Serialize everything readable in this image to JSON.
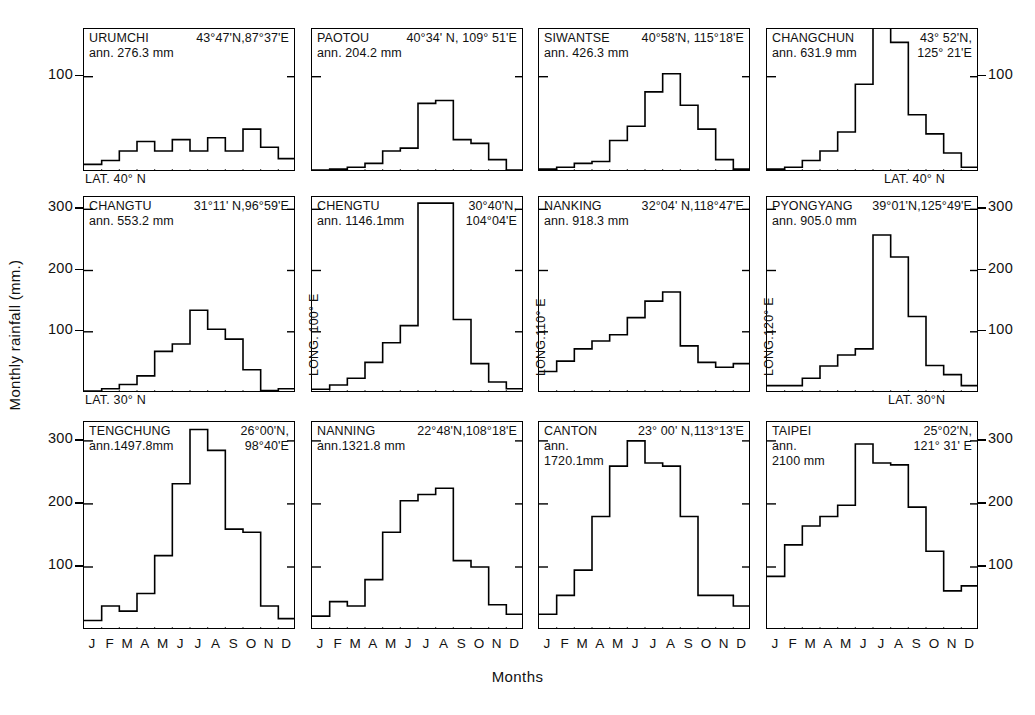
{
  "figure": {
    "ylabel": "Monthly rainfall (mm.)",
    "xlabel": "Months",
    "months": [
      "J",
      "F",
      "M",
      "A",
      "M",
      "J",
      "J",
      "A",
      "S",
      "O",
      "N",
      "D"
    ],
    "lat_labels": [
      {
        "text": "LAT. 40° N"
      },
      {
        "text": "LAT. 40° N"
      },
      {
        "text": "LAT. 30° N"
      },
      {
        "text": "LAT. 30°N"
      }
    ],
    "long_labels": [
      {
        "text": "LONG. 100° E"
      },
      {
        "text": "LONG.110° E"
      },
      {
        "text": "LONG.120° E"
      }
    ],
    "line_color": "#000000",
    "border_color": "#000000"
  },
  "axes": {
    "row1_left_ticks": [
      "100"
    ],
    "row1_right_ticks": [
      "100"
    ],
    "row2_left_ticks": [
      "300",
      "200",
      "100"
    ],
    "row2_right_ticks": [
      "300",
      "200",
      "100"
    ],
    "row3_left_ticks": [
      "300",
      "200",
      "100"
    ],
    "row3_right_ticks": [
      "300",
      "200",
      "100"
    ]
  },
  "chart_data": {
    "type": "bar",
    "xlabel": "Months",
    "ylabel": "Monthly rainfall (mm.)",
    "categories": [
      "J",
      "F",
      "M",
      "A",
      "M",
      "J",
      "J",
      "A",
      "S",
      "O",
      "N",
      "D"
    ],
    "grid": false,
    "legend": "none",
    "panels": [
      {
        "row": 1,
        "col": 1,
        "station": "URUMCHI",
        "coords": "43°47'N,87°37'E",
        "annual_label": "ann. 276.3 mm",
        "annual_mm": 276.3,
        "ylim": [
          0,
          150
        ],
        "yticks": [
          100
        ],
        "values": [
          8,
          12,
          22,
          32,
          22,
          34,
          22,
          36,
          22,
          45,
          26,
          14
        ]
      },
      {
        "row": 1,
        "col": 2,
        "station": "PAOTOU",
        "coords": "40°34' N, 109° 51'E",
        "annual_label": "ann. 204.2 mm",
        "annual_mm": 204.2,
        "ylim": [
          0,
          150
        ],
        "yticks": [
          100
        ],
        "values": [
          2,
          3,
          5,
          9,
          22,
          25,
          72,
          75,
          34,
          30,
          13,
          2
        ]
      },
      {
        "row": 1,
        "col": 3,
        "station": "SIWANTSE",
        "coords": "40°58'N, 115°18'E",
        "annual_label": "ann. 426.3 mm",
        "annual_mm": 426.3,
        "ylim": [
          0,
          150
        ],
        "yticks": [
          100
        ],
        "values": [
          3,
          5,
          9,
          11,
          33,
          48,
          84,
          103,
          70,
          45,
          13,
          3
        ]
      },
      {
        "row": 1,
        "col": 4,
        "station": "CHANGCHUN",
        "coords": "43° 52'N, 125° 21'E",
        "annual_label": "ann. 631.9 mm",
        "annual_mm": 631.9,
        "ylim": [
          0,
          150
        ],
        "yticks": [
          100
        ],
        "values": [
          3,
          5,
          12,
          22,
          42,
          92,
          164,
          136,
          60,
          40,
          20,
          5
        ]
      },
      {
        "row": 2,
        "col": 1,
        "station": "CHANGTU",
        "coords": "31°11' N,96°59'E",
        "annual_label": "ann. 553.2 mm",
        "annual_mm": 553.2,
        "ylim": [
          0,
          320
        ],
        "yticks": [
          100,
          200,
          300
        ],
        "values": [
          3,
          7,
          14,
          28,
          68,
          80,
          135,
          104,
          88,
          38,
          4,
          7
        ]
      },
      {
        "row": 2,
        "col": 2,
        "station": "CHENGTU",
        "coords": "30°40'N, 104°04'E",
        "annual_label": "ann. 1146.1mm",
        "annual_mm": 1146.1,
        "ylim": [
          0,
          320
        ],
        "yticks": [
          100,
          200,
          300
        ],
        "values": [
          6,
          13,
          24,
          50,
          82,
          110,
          310,
          310,
          120,
          48,
          18,
          7
        ]
      },
      {
        "row": 2,
        "col": 3,
        "station": "NANKING",
        "coords": "32°04' N,118°47'E",
        "annual_label": "ann. 918.3 mm",
        "annual_mm": 918.3,
        "ylim": [
          0,
          320
        ],
        "yticks": [
          100,
          200,
          300
        ],
        "values": [
          35,
          52,
          72,
          85,
          95,
          123,
          150,
          165,
          77,
          50,
          42,
          48
        ]
      },
      {
        "row": 2,
        "col": 4,
        "station": "PYONGYANG",
        "coords": "39°01'N,125°49'E",
        "annual_label": "ann. 905.0 mm",
        "annual_mm": 905.0,
        "ylim": [
          0,
          320
        ],
        "yticks": [
          100,
          200,
          300
        ],
        "values": [
          12,
          12,
          24,
          44,
          62,
          72,
          258,
          222,
          125,
          45,
          30,
          12
        ]
      },
      {
        "row": 3,
        "col": 1,
        "station": "TENGCHUNG",
        "coords": "26°00'N, 98°40'E",
        "annual_label": "ann.1497.8mm",
        "annual_mm": 1497.8,
        "ylim": [
          0,
          330
        ],
        "yticks": [
          100,
          200,
          300
        ],
        "values": [
          15,
          38,
          30,
          58,
          118,
          232,
          318,
          285,
          160,
          155,
          38,
          18
        ]
      },
      {
        "row": 3,
        "col": 2,
        "station": "NANNING",
        "coords": "22°48'N,108°18'E",
        "annual_label": "ann.1321.8 mm",
        "annual_mm": 1321.8,
        "ylim": [
          0,
          330
        ],
        "yticks": [
          100,
          200,
          300
        ],
        "values": [
          22,
          45,
          38,
          80,
          155,
          205,
          215,
          225,
          110,
          100,
          40,
          25
        ]
      },
      {
        "row": 3,
        "col": 3,
        "station": "CANTON",
        "coords": "23° 00' N,113°13'E",
        "annual_label": "ann. 1720.1mm",
        "annual_mm": 1720.1,
        "ylim": [
          0,
          330
        ],
        "yticks": [
          100,
          200,
          300
        ],
        "values": [
          25,
          55,
          95,
          180,
          260,
          300,
          265,
          260,
          180,
          55,
          55,
          38
        ]
      },
      {
        "row": 3,
        "col": 4,
        "station": "TAIPEI",
        "coords": "25°02'N, 121° 31' E",
        "annual_label": "ann. 2100 mm",
        "annual_mm": 2100,
        "ylim": [
          0,
          330
        ],
        "yticks": [
          100,
          200,
          300
        ],
        "values": [
          85,
          135,
          165,
          180,
          198,
          295,
          265,
          262,
          195,
          125,
          62,
          70
        ]
      }
    ]
  }
}
